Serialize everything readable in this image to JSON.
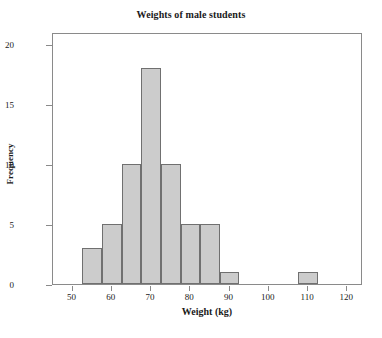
{
  "chart_data": {
    "type": "bar",
    "title": "Weights of male students",
    "xlabel": "Weight (kg)",
    "ylabel": "Frequency",
    "xlim": [
      45,
      124
    ],
    "ylim": [
      0,
      21
    ],
    "grid": false,
    "legend": null,
    "bin_width": 5,
    "bin_edges": [
      52.5,
      57.5,
      62.5,
      67.5,
      72.5,
      77.5,
      82.5,
      87.5,
      92.5,
      97.5,
      102.5,
      107.5,
      112.5
    ],
    "bin_centers": [
      55,
      60,
      65,
      70,
      75,
      80,
      85,
      90,
      95,
      100,
      105,
      110
    ],
    "categories": [
      "52.5-57.5",
      "57.5-62.5",
      "62.5-67.5",
      "67.5-72.5",
      "72.5-77.5",
      "77.5-82.5",
      "82.5-87.5",
      "87.5-92.5",
      "92.5-97.5",
      "97.5-102.5",
      "102.5-107.5",
      "107.5-112.5"
    ],
    "values": [
      3,
      5,
      10,
      18,
      10,
      5,
      5,
      1,
      0,
      0,
      0,
      1
    ],
    "xticks": [
      50,
      60,
      70,
      80,
      90,
      100,
      110,
      120
    ],
    "xtick_labels": [
      "50",
      "60",
      "70",
      "80",
      "90",
      "100",
      "110",
      "120"
    ],
    "yticks": [
      0,
      5,
      10,
      15,
      20
    ],
    "ytick_labels": [
      "0",
      "5",
      "10",
      "15",
      "20"
    ],
    "bar_fill_color": "#cccccc",
    "bar_edge_color": "#707070",
    "axis_color": "#8a8a8a",
    "text_color": "#1a1a1a",
    "background_color": "#ffffff",
    "total_count": 58
  }
}
